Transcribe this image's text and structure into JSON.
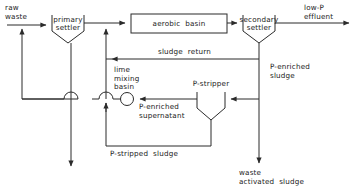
{
  "diagram": {
    "units": [
      {
        "key": "primary_settler",
        "label": "primary\nsettler",
        "shape": "hopper"
      },
      {
        "key": "aerobic_basin",
        "label": "aerobic  basin",
        "shape": "rectangle"
      },
      {
        "key": "secondary_settler",
        "label": "secondary\nsettler",
        "shape": "hopper"
      },
      {
        "key": "lime_mixing_basin",
        "label": "lime\nmixing\nbasin",
        "shape": "circle"
      },
      {
        "key": "p_stripper",
        "label": "P-stripper",
        "shape": "hopper"
      }
    ],
    "streams": [
      {
        "key": "raw_waste",
        "label": "raw\nwaste"
      },
      {
        "key": "low_p_effluent",
        "label": "low-P\neffluent"
      },
      {
        "key": "sludge_return",
        "label": "sludge  return"
      },
      {
        "key": "p_enriched_sludge",
        "label": "P-enriched\nsludge"
      },
      {
        "key": "p_enriched_supernatant",
        "label": "P-enriched\nsupernatant"
      },
      {
        "key": "p_stripped_sludge",
        "label": "P-stripped  sludge"
      },
      {
        "key": "waste_activated_sludge",
        "label": "waste\nactivated  sludge"
      }
    ],
    "style": {
      "line_color": "#2b2b2b",
      "text_color": "#1a1a1a",
      "background": "#ffffff"
    }
  }
}
